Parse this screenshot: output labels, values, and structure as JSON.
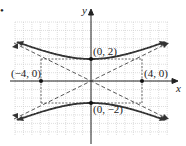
{
  "chart_data": {
    "type": "line",
    "title": "",
    "xlabel": "x",
    "ylabel": "y",
    "grid": true,
    "xlim": [
      -7.5,
      7.5
    ],
    "ylim": [
      -5.3,
      5.3
    ],
    "series": [
      {
        "name": "upper branch",
        "style": "solid",
        "equation": "y = 2*sqrt(1 + x^2/16)",
        "x": [
          -7,
          -6,
          -4,
          -2,
          0,
          2,
          4,
          6,
          7
        ],
        "y": [
          4.03,
          3.61,
          2.83,
          2.24,
          2,
          2.24,
          2.83,
          3.61,
          4.03
        ]
      },
      {
        "name": "lower branch",
        "style": "solid",
        "equation": "y = -2*sqrt(1 + x^2/16)",
        "x": [
          -7,
          -6,
          -4,
          -2,
          0,
          2,
          4,
          6,
          7
        ],
        "y": [
          -4.03,
          -3.61,
          -2.83,
          -2.24,
          -2,
          -2.24,
          -2.83,
          -3.61,
          -4.03
        ]
      },
      {
        "name": "asymptote 1",
        "style": "dashed",
        "equation": "y = x/2",
        "x": [
          -7.5,
          7.5
        ],
        "y": [
          -3.75,
          3.75
        ]
      },
      {
        "name": "asymptote 2",
        "style": "dashed",
        "equation": "y = -x/2",
        "x": [
          -7.5,
          7.5
        ],
        "y": [
          3.75,
          -3.75
        ]
      }
    ],
    "points": [
      {
        "label": "(0, 2)",
        "x": 0,
        "y": 2
      },
      {
        "label": "(0, −2)",
        "x": 0,
        "y": -2
      },
      {
        "label": "(−4, 0)",
        "x": -4,
        "y": 0
      },
      {
        "label": "(4, 0)",
        "x": 4,
        "y": 0
      }
    ],
    "rectangle": {
      "corners": [
        [
          -4,
          2
        ],
        [
          4,
          2
        ],
        [
          4,
          -2
        ],
        [
          -4,
          -2
        ]
      ],
      "style": "dashed"
    }
  },
  "labels": {
    "marker": "•",
    "x_axis": "x",
    "y_axis": "y",
    "p_top": "(0, 2)",
    "p_bottom": "(0, −2)",
    "p_left": "(−4, 0)",
    "p_right": "(4, 0)"
  }
}
